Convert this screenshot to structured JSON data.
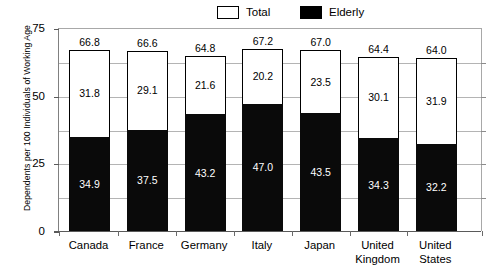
{
  "chart_data": {
    "type": "bar",
    "subtype": "stacked-segments",
    "title": "",
    "xlabel": "",
    "ylabel": "Dependents per 100 Individuals of Working Age",
    "ylim": [
      0,
      75
    ],
    "yticks": [
      0,
      25,
      50,
      75
    ],
    "ytick_labels": [
      "0",
      "25",
      "50",
      "75"
    ],
    "gridlines": [
      12.5,
      25,
      37.5,
      50,
      62.5
    ],
    "grid": true,
    "legend_position": "top-center",
    "categories": [
      "Canada",
      "France",
      "Germany",
      "Italy",
      "Japan",
      "United Kingdom",
      "United States"
    ],
    "series": [
      {
        "name": "Elderly",
        "color": "#000000",
        "values": [
          34.9,
          37.5,
          43.2,
          47.0,
          43.5,
          34.3,
          32.2
        ]
      },
      {
        "name": "Youth",
        "color": "#ffffff",
        "values": [
          31.8,
          29.1,
          21.6,
          20.2,
          23.5,
          30.1,
          31.9
        ]
      },
      {
        "name": "Total",
        "color": "#ffffff",
        "values": [
          66.8,
          66.6,
          64.8,
          67.2,
          67.0,
          64.4,
          64.0
        ]
      }
    ],
    "annotations": {
      "total_labels": [
        "66.8",
        "66.6",
        "64.8",
        "67.2",
        "67.0",
        "64.4",
        "64.0"
      ],
      "middle_labels": [
        "31.8",
        "29.1",
        "21.6",
        "20.2",
        "23.5",
        "30.1",
        "31.9"
      ],
      "elderly_labels": [
        "34.9",
        "37.5",
        "43.2",
        "47.0",
        "43.5",
        "34.3",
        "32.2"
      ]
    }
  },
  "legend": {
    "items": [
      {
        "label": "Total",
        "swatch": "hollow"
      },
      {
        "label": "Elderly",
        "swatch": "filled"
      }
    ]
  },
  "axis": {
    "y_title": "Dependents per 100 Individuals of Working Age",
    "y_labels": [
      "75",
      "50",
      "25",
      "0"
    ],
    "x_labels": [
      "Canada",
      "France",
      "Germany",
      "Italy",
      "Japan",
      "United\nKingdom",
      "United\nStates"
    ]
  }
}
